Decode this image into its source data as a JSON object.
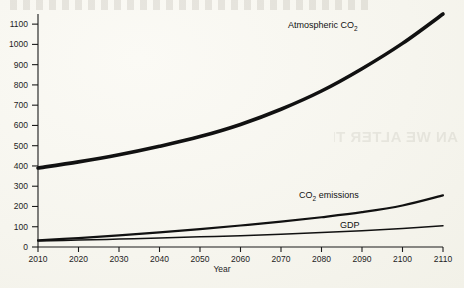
{
  "page": {
    "background_color": "#f7f6ef",
    "ink_color": "#111111",
    "bleed_through_text": "AN WE ALTER THE FUTURE?"
  },
  "chart_data": {
    "type": "line",
    "title": "",
    "xlabel": "Year",
    "ylabel": "",
    "xlim": [
      2010,
      2110
    ],
    "ylim": [
      0,
      1150
    ],
    "grid": false,
    "legend": "inline-labels",
    "x_ticks": [
      2010,
      2020,
      2030,
      2040,
      2050,
      2060,
      2070,
      2080,
      2090,
      2100,
      2110
    ],
    "y_ticks": [
      0,
      100,
      200,
      300,
      400,
      500,
      600,
      700,
      800,
      900,
      1000,
      1100
    ],
    "x": [
      2010,
      2020,
      2030,
      2040,
      2050,
      2060,
      2070,
      2080,
      2090,
      2100,
      2110
    ],
    "series": [
      {
        "name": "Atmospheric CO2",
        "label": "Atmospheric CO",
        "label_sub": "2",
        "line_weight": "thick",
        "values": [
          390,
          420,
          455,
          497,
          545,
          605,
          680,
          770,
          880,
          1005,
          1150
        ]
      },
      {
        "name": "CO2 emissions",
        "label": "CO",
        "label_sub": "2",
        "label_tail": " emissions",
        "line_weight": "medium",
        "values": [
          33,
          44,
          57,
          72,
          88,
          106,
          125,
          147,
          172,
          205,
          255
        ]
      },
      {
        "name": "GDP",
        "label": "GDP",
        "label_sub": "",
        "line_weight": "thin",
        "values": [
          30,
          34,
          39,
          44,
          50,
          56,
          63,
          71,
          80,
          91,
          105
        ]
      }
    ]
  },
  "labels": {
    "co2_atmos_x": 288,
    "co2_atmos_y": 28,
    "co2_emis_x": 299,
    "co2_emis_y": 198,
    "gdp_x": 340,
    "gdp_y": 228
  }
}
